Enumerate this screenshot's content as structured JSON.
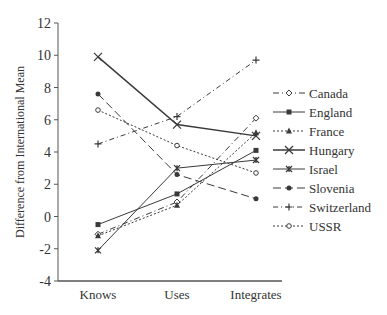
{
  "chart_data": {
    "type": "line",
    "title": "",
    "xlabel": "",
    "ylabel": "Difference from International Mean",
    "categories": [
      "Knows",
      "Uses",
      "Integrates"
    ],
    "ylim": [
      -4,
      12
    ],
    "yticks": [
      -4,
      -2,
      0,
      2,
      4,
      6,
      8,
      10,
      12
    ],
    "grid": false,
    "legend_position": "right",
    "series": [
      {
        "name": "Canada",
        "values": [
          -1.1,
          0.9,
          6.1
        ],
        "marker": "diamond-open",
        "dash": "6,3,1,3"
      },
      {
        "name": "England",
        "values": [
          -0.5,
          1.4,
          4.1
        ],
        "marker": "square",
        "dash": ""
      },
      {
        "name": "France",
        "values": [
          -1.2,
          0.7,
          5.2
        ],
        "marker": "triangle",
        "dash": "2,2"
      },
      {
        "name": "Hungary",
        "values": [
          9.9,
          5.7,
          5.0
        ],
        "marker": "x",
        "dash": ""
      },
      {
        "name": "Israel",
        "values": [
          -2.1,
          3.0,
          3.5
        ],
        "marker": "asterisk",
        "dash": ""
      },
      {
        "name": "Slovenia",
        "values": [
          7.6,
          2.6,
          1.1
        ],
        "marker": "circle",
        "dash": "8,4"
      },
      {
        "name": "Switzerland",
        "values": [
          4.5,
          6.2,
          9.7
        ],
        "marker": "plus",
        "dash": "5,3,1,3"
      },
      {
        "name": "USSR",
        "values": [
          6.6,
          4.4,
          2.7
        ],
        "marker": "circle-open",
        "dash": "2,2"
      }
    ]
  },
  "colors": {
    "line": "#3a3a3a",
    "axis": "#555555"
  }
}
